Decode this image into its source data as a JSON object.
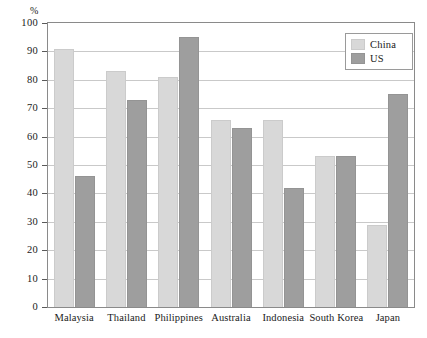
{
  "chart_data": {
    "type": "bar",
    "title": "",
    "xlabel": "",
    "ylabel": "%",
    "ylim": [
      0,
      100
    ],
    "ytick_step": 10,
    "yticks": [
      "100",
      "90",
      "80",
      "70",
      "60",
      "50",
      "40",
      "30",
      "20",
      "10",
      "0"
    ],
    "grid": true,
    "legend_position": "top-right",
    "categories": [
      "Malaysia",
      "Thailand",
      "Philippines",
      "Australia",
      "Indonesia",
      "South Korea",
      "Japan"
    ],
    "series": [
      {
        "name": "China",
        "color": "#d8d8d8",
        "values": [
          91,
          83,
          81,
          66,
          66,
          53,
          29
        ]
      },
      {
        "name": "US",
        "color": "#9e9e9e",
        "values": [
          46,
          73,
          95,
          63,
          42,
          53,
          75
        ]
      }
    ]
  },
  "legend": {
    "items": [
      {
        "label": "China"
      },
      {
        "label": "US"
      }
    ]
  }
}
